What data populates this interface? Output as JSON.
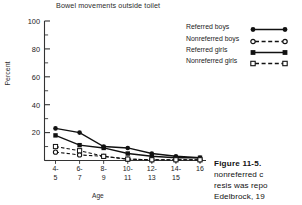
{
  "chart_data": {
    "type": "line",
    "title": "Bowel movements outside toilet",
    "xlabel": "Age",
    "ylabel": "Percent",
    "ylim": [
      0,
      100
    ],
    "yticks": [
      0,
      20,
      40,
      60,
      80,
      100
    ],
    "ytick_labels": [
      "",
      "20",
      "40",
      "60",
      "80",
      "100"
    ],
    "yminor_step": 10,
    "grid": false,
    "legend_position": "upper right",
    "categories": [
      "4-\n5",
      "6-\n7",
      "8-\n9",
      "10-\n11",
      "12-\n13",
      "14-\n15",
      "16"
    ],
    "category_lines": [
      [
        "4-",
        "5"
      ],
      [
        "6-",
        "7"
      ],
      [
        "8-",
        "9"
      ],
      [
        "10-",
        "11"
      ],
      [
        "12-",
        "13"
      ],
      [
        "14-",
        "15"
      ],
      [
        "16",
        ""
      ]
    ],
    "series": [
      {
        "name": "Referred boys",
        "marker": "filled-circle",
        "line": "solid",
        "values": [
          23,
          20,
          10,
          9,
          5,
          3,
          2
        ]
      },
      {
        "name": "Nonreferred boys",
        "marker": "open-circle",
        "line": "dashed",
        "values": [
          6,
          4,
          3,
          1,
          0.5,
          0.5,
          0.5
        ]
      },
      {
        "name": "Referred girls",
        "marker": "filled-square",
        "line": "solid",
        "values": [
          18,
          11,
          9,
          5,
          3,
          2,
          2
        ]
      },
      {
        "name": "Nonreferred girls",
        "marker": "open-square",
        "line": "dashed",
        "values": [
          10,
          7,
          3,
          1,
          0.5,
          0.5,
          0.5
        ]
      }
    ]
  },
  "legend": {
    "items": [
      {
        "label": "Referred boys"
      },
      {
        "label": "Nonreferred boys"
      },
      {
        "label": "Referred girls"
      },
      {
        "label": "Nonreferred girls"
      }
    ]
  },
  "caption": {
    "heading": "Figure 11-5.",
    "lines": [
      "nonreferred c",
      "resis was repo",
      "Edelbrock, 19"
    ]
  },
  "colors": {
    "ink": "#1a1a1a",
    "axis": "#333333",
    "background": "#ffffff"
  }
}
